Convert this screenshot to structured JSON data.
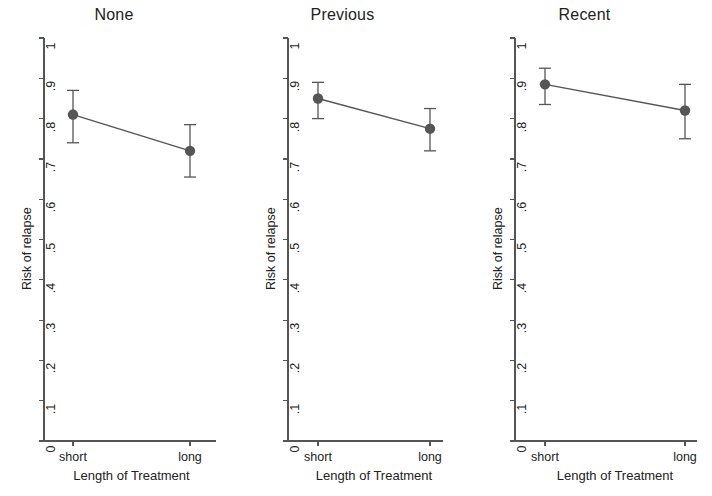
{
  "figure": {
    "background_color": "#ffffff",
    "ink_color": "#555555",
    "text_color": "#222222",
    "marker_color": "#555555"
  },
  "chart_data": {
    "type": "line",
    "title": "",
    "xlabel": "Length of Treatment",
    "ylabel": "Risk of relapse",
    "categories": [
      "short",
      "long"
    ],
    "ylim": [
      0,
      1
    ],
    "xlim": [
      0,
      1
    ],
    "grid": false,
    "legend": "none",
    "ytick_labels": [
      "0",
      ".1",
      ".2",
      ".3",
      ".4",
      ".5",
      ".6",
      ".7",
      ".8",
      ".9",
      "1"
    ],
    "ytick_values": [
      0,
      0.1,
      0.2,
      0.3,
      0.4,
      0.5,
      0.6,
      0.7,
      0.8,
      0.9,
      1
    ],
    "xtick_labels": [
      "short",
      "long"
    ],
    "error_bars": "95% confidence interval",
    "panels": [
      {
        "name": "panel-none",
        "title": "None",
        "xlabel": "Length of Treatment",
        "ylabel": "Risk of relapse",
        "x": [
          "short",
          "long"
        ],
        "values": [
          0.81,
          0.72
        ],
        "ci_low": [
          0.74,
          0.655
        ],
        "ci_high": [
          0.87,
          0.785
        ]
      },
      {
        "name": "panel-previous",
        "title": "Previous",
        "xlabel": "Length of Treatment",
        "ylabel": "Risk of relapse",
        "x": [
          "short",
          "long"
        ],
        "values": [
          0.85,
          0.775
        ],
        "ci_low": [
          0.8,
          0.72
        ],
        "ci_high": [
          0.89,
          0.825
        ]
      },
      {
        "name": "panel-recent",
        "title": "Recent",
        "xlabel": "Length of Treatment",
        "ylabel": "Risk of relapse",
        "x": [
          "short",
          "long"
        ],
        "values": [
          0.885,
          0.82
        ],
        "ci_low": [
          0.835,
          0.75
        ],
        "ci_high": [
          0.925,
          0.885
        ]
      }
    ]
  }
}
